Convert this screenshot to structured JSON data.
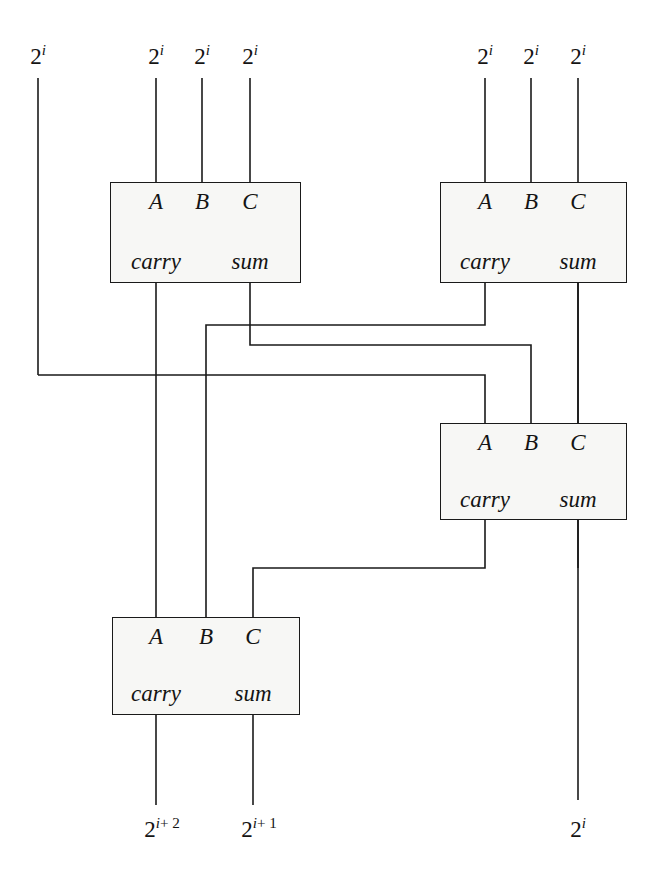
{
  "diagram": {
    "stroke_color": "#1a1a1a",
    "box_fill": "#f7f7f5"
  },
  "adders": [
    {
      "id": "adder-top-left",
      "inputs": [
        "A",
        "B",
        "C"
      ],
      "outputs": [
        "carry",
        "sum"
      ]
    },
    {
      "id": "adder-top-right",
      "inputs": [
        "A",
        "B",
        "C"
      ],
      "outputs": [
        "carry",
        "sum"
      ]
    },
    {
      "id": "adder-middle-right",
      "inputs": [
        "A",
        "B",
        "C"
      ],
      "outputs": [
        "carry",
        "sum"
      ]
    },
    {
      "id": "adder-bottom-left",
      "inputs": [
        "A",
        "B",
        "C"
      ],
      "outputs": [
        "carry",
        "sum"
      ]
    }
  ],
  "labels": {
    "A": "A",
    "B": "B",
    "C": "C",
    "carry": "carry",
    "sum": "sum"
  },
  "inputs": [
    {
      "id": "in-0",
      "base": "2",
      "exp": "i"
    },
    {
      "id": "in-1",
      "base": "2",
      "exp": "i"
    },
    {
      "id": "in-2",
      "base": "2",
      "exp": "i"
    },
    {
      "id": "in-3",
      "base": "2",
      "exp": "i"
    },
    {
      "id": "in-4",
      "base": "2",
      "exp": "i"
    },
    {
      "id": "in-5",
      "base": "2",
      "exp": "i"
    },
    {
      "id": "in-6",
      "base": "2",
      "exp": "i"
    }
  ],
  "outputs": [
    {
      "id": "out-carry2",
      "base": "2",
      "exp": "i",
      "plus": "+ 2"
    },
    {
      "id": "out-carry1",
      "base": "2",
      "exp": "i",
      "plus": "+ 1"
    },
    {
      "id": "out-sum",
      "base": "2",
      "exp": "i",
      "plus": ""
    }
  ]
}
